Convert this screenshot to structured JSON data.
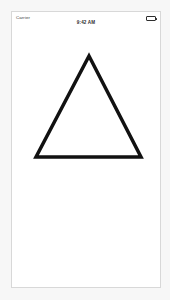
{
  "canvas": {
    "width": 170,
    "height": 300,
    "background_color": "#f7f7f7"
  },
  "device": {
    "frame_color": "#d8d8d8",
    "screen_color": "#ffffff"
  },
  "status_bar": {
    "carrier_label": "Carrier",
    "wifi_icon_name": "wifi-icon",
    "time": "9:42 AM",
    "battery_icon_name": "battery-full-icon",
    "battery_level_percent": 100,
    "text_color": "#2e2e2e"
  },
  "content": {
    "shape": {
      "name": "triangle",
      "type": "polygon",
      "sides": 3,
      "stroke_color": "#111111",
      "stroke_width": 3.5,
      "fill": "none",
      "line_join": "miter",
      "points": [
        {
          "x": 77,
          "y": 31
        },
        {
          "x": 129,
          "y": 132
        },
        {
          "x": 24,
          "y": 132
        }
      ],
      "apex_label": "top",
      "base_width": 105,
      "height": 101
    }
  }
}
